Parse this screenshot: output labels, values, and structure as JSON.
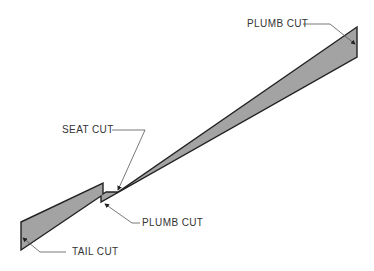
{
  "diagram": {
    "colors": {
      "fill": "#a3a3a3",
      "outline": "#222222",
      "leader": "#555555",
      "text": "#333333"
    },
    "labels": [
      {
        "id": "plumb-cut-top",
        "text": "PLUMB CUT"
      },
      {
        "id": "seat-cut",
        "text": "SEAT CUT"
      },
      {
        "id": "plumb-cut-notch",
        "text": "PLUMB CUT"
      },
      {
        "id": "tail-cut",
        "text": "TAIL CUT"
      }
    ]
  }
}
